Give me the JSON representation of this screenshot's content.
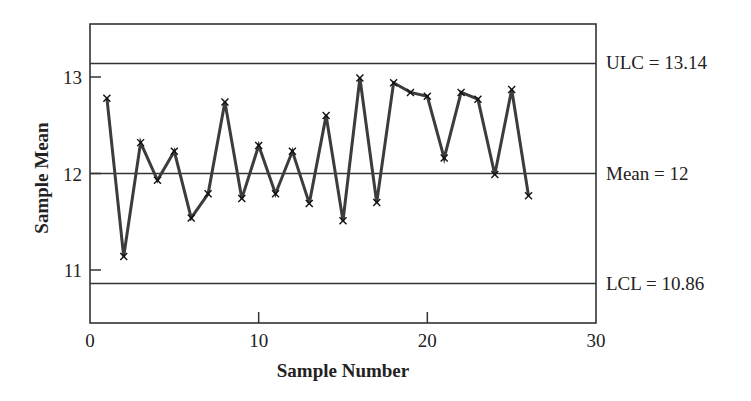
{
  "chart_data": {
    "type": "line",
    "title": "",
    "xlabel": "Sample Number",
    "ylabel": "Sample Mean",
    "xlim": [
      0,
      30
    ],
    "ylim": [
      10.47,
      13.55
    ],
    "grid": false,
    "legend": "none",
    "x_ticks": [
      0,
      10,
      20,
      30
    ],
    "x_tick_labels": [
      "0",
      "10",
      "20",
      "30"
    ],
    "y_ticks": [
      11,
      12,
      13
    ],
    "y_tick_labels": [
      "11",
      "12",
      "13"
    ],
    "marker": "x",
    "series": [
      {
        "name": "Sample Mean",
        "x": [
          1,
          2,
          3,
          4,
          5,
          6,
          7,
          8,
          9,
          10,
          11,
          12,
          13,
          14,
          15,
          16,
          17,
          18,
          19,
          20,
          21,
          22,
          23,
          24,
          25,
          26
        ],
        "values": [
          12.78,
          11.14,
          12.32,
          11.93,
          12.23,
          11.54,
          11.79,
          12.74,
          11.74,
          12.29,
          11.79,
          12.23,
          11.69,
          12.6,
          11.51,
          12.99,
          11.7,
          12.94,
          12.84,
          12.8,
          12.16,
          12.84,
          12.77,
          11.99,
          12.87,
          11.77
        ]
      }
    ],
    "reference_lines": [
      {
        "name": "ULC",
        "value": 13.14,
        "label": "ULC = 13.14"
      },
      {
        "name": "Mean",
        "value": 12,
        "label": "Mean = 12"
      },
      {
        "name": "LCL",
        "value": 10.86,
        "label": "LCL = 10.86"
      }
    ]
  },
  "colors": {
    "line": "#3c3c3c",
    "axis": "#333333",
    "text": "#222222",
    "background": "#ffffff"
  }
}
